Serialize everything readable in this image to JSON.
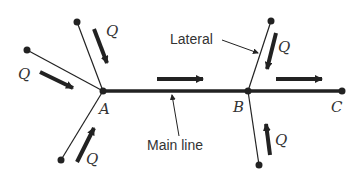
{
  "diagram": {
    "colors": {
      "line": "#222222",
      "text": "#333333",
      "background": "#ffffff"
    },
    "nodes": [
      {
        "id": "A",
        "label": "A",
        "x": 103,
        "y": 91
      },
      {
        "id": "B",
        "label": "B",
        "x": 248,
        "y": 91
      },
      {
        "id": "C",
        "label": "C",
        "x": 342,
        "y": 91
      }
    ],
    "lateral_ends": [
      {
        "id": "A1",
        "x": 77,
        "y": 22
      },
      {
        "id": "A2",
        "x": 27,
        "y": 50
      },
      {
        "id": "A3",
        "x": 61,
        "y": 160
      },
      {
        "id": "B1",
        "x": 271,
        "y": 21
      },
      {
        "id": "B2",
        "x": 259,
        "y": 165
      }
    ],
    "flow_label": "Q",
    "flow_labels": [
      {
        "text": "Q",
        "x": 106,
        "y": 36
      },
      {
        "text": "Q",
        "x": 18,
        "y": 79
      },
      {
        "text": "Q",
        "x": 86,
        "y": 164
      },
      {
        "text": "Q",
        "x": 278,
        "y": 52
      },
      {
        "text": "Q",
        "x": 275,
        "y": 145
      }
    ],
    "annotations": {
      "lateral": "Lateral",
      "main_line": "Main line"
    }
  }
}
